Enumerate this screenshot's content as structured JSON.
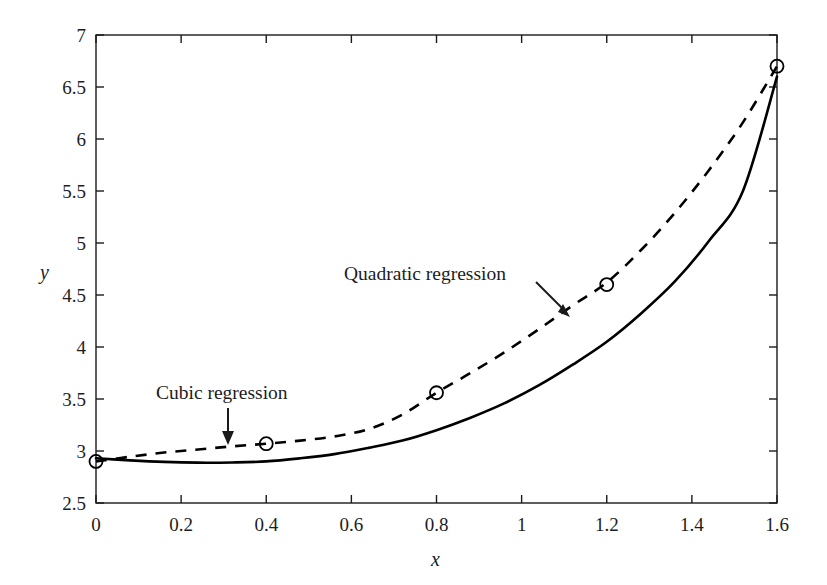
{
  "chart_data": {
    "type": "line",
    "title": "",
    "xlabel": "x",
    "ylabel": "y",
    "xlim": [
      0,
      1.6
    ],
    "ylim": [
      2.5,
      7
    ],
    "xticks": [
      "0",
      "0.2",
      "0.4",
      "0.6",
      "0.8",
      "1",
      "1.2",
      "1.4",
      "1.6"
    ],
    "xtick_values": [
      0,
      0.2,
      0.4,
      0.6,
      0.8,
      1,
      1.2,
      1.4,
      1.6
    ],
    "yticks": [
      "2.5",
      "3",
      "3.5",
      "4",
      "4.5",
      "5",
      "5.5",
      "6",
      "6.5",
      "7"
    ],
    "ytick_values": [
      2.5,
      3,
      3.5,
      4,
      4.5,
      5,
      5.5,
      6,
      6.5,
      7
    ],
    "grid": false,
    "legend_position": "none",
    "points": {
      "name": "Data points",
      "marker": "open-circle",
      "x": [
        0,
        0.4,
        0.8,
        1.2,
        1.6
      ],
      "y": [
        2.9,
        3.07,
        3.56,
        4.6,
        6.7
      ]
    },
    "series": [
      {
        "name": "Quadratic regression",
        "style": "solid",
        "color": "#000000",
        "x": [
          0,
          0.08,
          0.16,
          0.24,
          0.32,
          0.4,
          0.48,
          0.56,
          0.64,
          0.72,
          0.8,
          0.88,
          0.96,
          1.04,
          1.12,
          1.2,
          1.28,
          1.36,
          1.44,
          1.52,
          1.6
        ],
        "y": [
          2.93,
          2.91,
          2.895,
          2.888,
          2.89,
          2.9,
          2.93,
          2.97,
          3.03,
          3.1,
          3.2,
          3.32,
          3.46,
          3.63,
          3.83,
          4.05,
          4.32,
          4.63,
          5.02,
          5.5,
          6.6
        ]
      },
      {
        "name": "Cubic regression",
        "style": "dashed",
        "color": "#000000",
        "x": [
          0,
          0.08,
          0.16,
          0.24,
          0.32,
          0.4,
          0.48,
          0.56,
          0.64,
          0.72,
          0.8,
          0.88,
          0.96,
          1.04,
          1.12,
          1.2,
          1.28,
          1.36,
          1.44,
          1.52,
          1.6
        ],
        "y": [
          2.9,
          2.945,
          2.985,
          3.015,
          3.045,
          3.07,
          3.1,
          3.14,
          3.21,
          3.35,
          3.56,
          3.75,
          3.95,
          4.17,
          4.4,
          4.62,
          4.93,
          5.29,
          5.7,
          6.16,
          6.7
        ]
      }
    ],
    "annotations": [
      {
        "id": "quadratic-regression-annotation",
        "text": "Quadratic regression",
        "points_to": "solid-curve",
        "arrow": "down-right"
      },
      {
        "id": "cubic-regression-annotation",
        "text": "Cubic regression",
        "points_to": "dashed-curve",
        "arrow": "down"
      }
    ]
  },
  "axes": {
    "y_label": "y",
    "x_label": "x"
  }
}
